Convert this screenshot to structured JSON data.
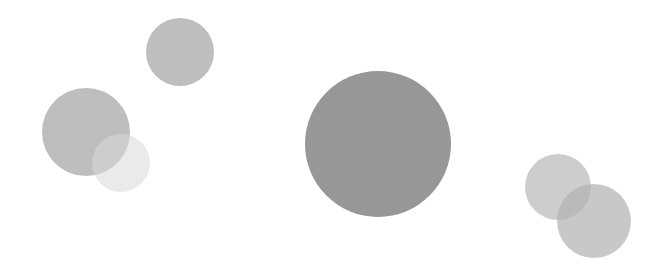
{
  "canvas": {
    "width": 657,
    "height": 270,
    "background": "#ffffff"
  },
  "circles": [
    {
      "id": "top-left-small",
      "cx": 180,
      "cy": 52,
      "r": 34,
      "color": "#b3b3b3",
      "opacity": 0.85
    },
    {
      "id": "left-large",
      "cx": 86,
      "cy": 132,
      "r": 44,
      "color": "#b3b3b3",
      "opacity": 0.85
    },
    {
      "id": "left-faint",
      "cx": 121,
      "cy": 163,
      "r": 29,
      "color": "#d9d9d9",
      "opacity": 0.55
    },
    {
      "id": "center-big",
      "cx": 378,
      "cy": 144,
      "r": 73,
      "color": "#8c8c8c",
      "opacity": 0.9
    },
    {
      "id": "right-upper",
      "cx": 558,
      "cy": 187,
      "r": 33,
      "color": "#b8b8b8",
      "opacity": 0.7
    },
    {
      "id": "right-lower",
      "cx": 594,
      "cy": 221,
      "r": 37,
      "color": "#b3b3b3",
      "opacity": 0.72
    }
  ]
}
